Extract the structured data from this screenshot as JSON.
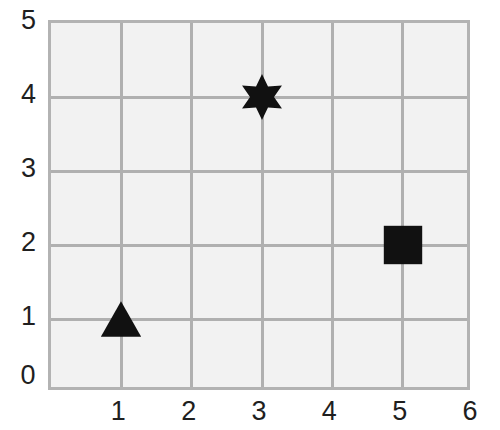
{
  "chart_data": {
    "type": "scatter",
    "title": "",
    "xlabel": "",
    "ylabel": "",
    "xlim": [
      0,
      6
    ],
    "ylim": [
      0,
      5
    ],
    "grid": true,
    "legend": "none",
    "x_ticks": [
      "0",
      "1",
      "2",
      "3",
      "4",
      "5",
      "6"
    ],
    "y_ticks": [
      "0",
      "1",
      "2",
      "3",
      "4",
      "5"
    ],
    "x_tick_values": [
      0,
      1,
      2,
      3,
      4,
      5,
      6
    ],
    "y_tick_values": [
      0,
      1,
      2,
      3,
      4,
      5
    ],
    "points": [
      {
        "label": "triangle-marker",
        "shape": "triangle",
        "x": 1,
        "y": 1,
        "color": "#111111",
        "size": 42
      },
      {
        "label": "star-marker",
        "shape": "star6",
        "x": 3,
        "y": 4,
        "color": "#111111",
        "size": 48
      },
      {
        "label": "square-marker",
        "shape": "square",
        "x": 5,
        "y": 2,
        "color": "#111111",
        "size": 40
      }
    ]
  },
  "style": {
    "plot_background": "#f2f2f2",
    "grid_color": "#b0b0b0",
    "border_color": "#b3b3b3",
    "marker_color": "#111111",
    "page_background": "#ffffff",
    "tick_text_color": "#1f1f1f"
  }
}
